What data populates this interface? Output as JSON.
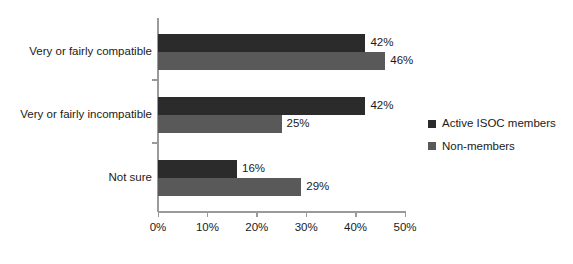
{
  "chart_data": {
    "type": "bar",
    "orientation": "horizontal",
    "title": "",
    "subtitle": "",
    "xlabel": "",
    "ylabel": "",
    "xlim": [
      0,
      50
    ],
    "xticks": [
      0,
      10,
      20,
      30,
      40,
      50
    ],
    "xtick_labels": [
      "0%",
      "10%",
      "20%",
      "30%",
      "40%",
      "50%"
    ],
    "grid": false,
    "legend_position": "right",
    "categories": [
      "Very or fairly compatible",
      "Very or fairly incompatible",
      "Not sure"
    ],
    "series": [
      {
        "name": "Active ISOC members",
        "color": "#2b2b2b",
        "values": [
          42,
          42,
          16
        ],
        "value_labels": [
          "42%",
          "42%",
          "16%"
        ]
      },
      {
        "name": "Non-members",
        "color": "#595959",
        "values": [
          46,
          25,
          29
        ],
        "value_labels": [
          "46%",
          "25%",
          "29%"
        ]
      }
    ]
  },
  "legend": {
    "items": [
      {
        "label": "Active ISOC members",
        "color": "#2b2b2b"
      },
      {
        "label": "Non-members",
        "color": "#595959"
      }
    ]
  },
  "axis": {
    "x_tick_labels": [
      "0%",
      "10%",
      "20%",
      "30%",
      "40%",
      "50%"
    ]
  },
  "colors": {
    "series_dark": "#2b2b2b",
    "series_gray": "#595959",
    "axis_line": "#9a9a9a",
    "text": "#1a1a1a",
    "background": "#ffffff"
  }
}
